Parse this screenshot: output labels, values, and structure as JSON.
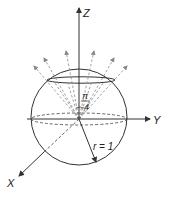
{
  "diagram": {
    "type": "sphere-cone-geometry",
    "axes": {
      "z_label": "Z",
      "y_label": "Y",
      "x_label": "X"
    },
    "angle_label": {
      "numerator": "π",
      "denominator": "4"
    },
    "radius_label": "r = 1",
    "colors": {
      "stroke": "#333333",
      "dashed": "#555555",
      "ray": "#777777",
      "background": "#ffffff"
    }
  }
}
